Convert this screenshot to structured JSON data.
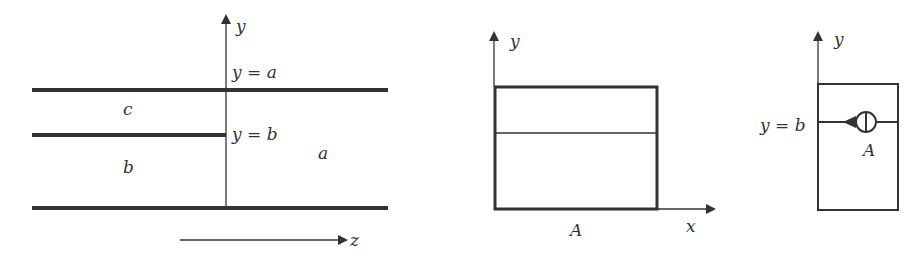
{
  "figure1": {
    "axis_y_label": "y",
    "axis_z_label": "z",
    "line_top_label": "y = a",
    "line_mid_label": "y = b",
    "region_c": "c",
    "region_b": "b",
    "region_a": "a"
  },
  "figure2": {
    "axis_y_label": "y",
    "axis_x_label": "x",
    "caption": "A"
  },
  "figure3": {
    "axis_y_label": "y",
    "line_label": "y = b",
    "source_label": "A"
  },
  "colors": {
    "stroke": "#333333",
    "background": "#ffffff"
  }
}
